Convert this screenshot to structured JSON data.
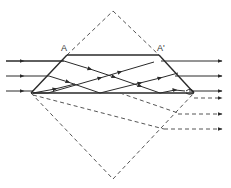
{
  "diagram": {
    "labels": {
      "left_corner": "A",
      "right_corner": "A'"
    },
    "colors": {
      "stroke": "#2a2a2a",
      "dashed": "#555555",
      "background": "#ffffff"
    },
    "prism": {
      "top_left": [
        67,
        55
      ],
      "top_right": [
        159,
        55
      ],
      "bottom_left": [
        31,
        93
      ],
      "bottom_right": [
        194,
        93
      ]
    },
    "unfolded_square": {
      "top": [
        113,
        11
      ],
      "left": [
        31,
        93
      ],
      "right": [
        194,
        93
      ],
      "bottom": [
        113,
        179
      ]
    },
    "input_rays_y": [
      61,
      76,
      91
    ],
    "output_rays_y": [
      61,
      76,
      91
    ],
    "virtual_rays_y": [
      98,
      114,
      129
    ]
  }
}
